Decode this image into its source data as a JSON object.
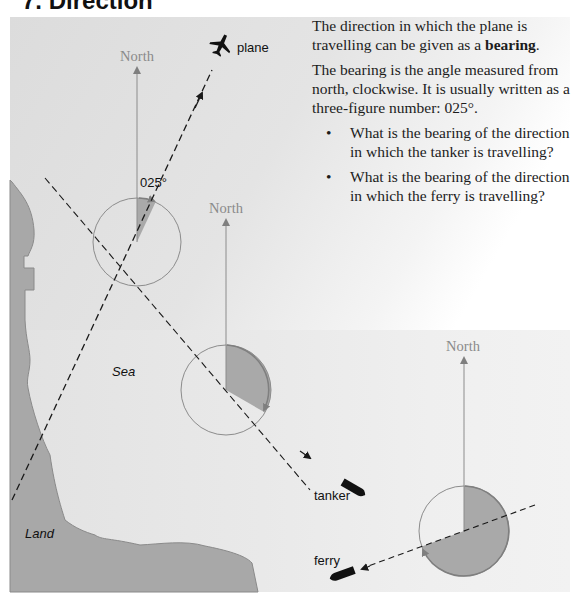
{
  "header": {
    "section_number": "7.",
    "title": "Direction"
  },
  "text": {
    "para1_before": "The direction in which the plane is travelling can be given as a ",
    "para1_bold": "bearing",
    "para1_after": ".",
    "para2": "The bearing is the angle measured from north, clockwise. It is usually written as a three-figure number: 025°.",
    "questions": [
      {
        "bullet": "•",
        "text": "What is the bearing of the direction in which the tanker is travelling?"
      },
      {
        "bullet": "•",
        "text": "What is the bearing of the direction in which the ferry is travelling?"
      }
    ]
  },
  "diagram": {
    "north_label": "North",
    "angle_label": "025°",
    "labels": {
      "plane": "plane",
      "tanker": "tanker",
      "ferry": "ferry",
      "sea": "Sea",
      "land": "Land"
    },
    "vessels": [
      {
        "name": "plane",
        "bearing_deg": 25,
        "icon": "airplane-icon"
      },
      {
        "name": "tanker",
        "bearing_deg": 120,
        "icon": "ship-icon"
      },
      {
        "name": "ferry",
        "bearing_deg": 250,
        "icon": "ship-icon"
      }
    ],
    "colors": {
      "sector_fill": "#a9a9a9",
      "circle_stroke": "#8c8c8c",
      "north_line": "#8c8c8c",
      "land_fill": "#a8a8a8",
      "coastline": "#8a8a8a",
      "dashed_line": "#1a1a1a"
    }
  }
}
